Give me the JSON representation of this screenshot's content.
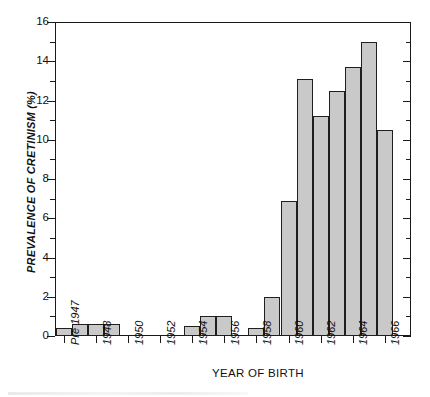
{
  "chart_data": {
    "type": "bar",
    "title": "",
    "xlabel": "YEAR OF BIRTH",
    "ylabel": "PREVALENCE OF CRETINISM (%)",
    "ylim": [
      0,
      16
    ],
    "y_major_ticks": [
      0,
      2,
      4,
      6,
      8,
      10,
      12,
      14,
      16
    ],
    "y_minor_ticks": [
      1,
      3,
      5,
      7,
      9,
      11,
      13,
      15
    ],
    "grid": false,
    "legend": null,
    "x_tick_labels": [
      "Pre 1947",
      "1948",
      "1950",
      "1952",
      "1954",
      "1956",
      "1958",
      "1960",
      "1962",
      "1964",
      "1966"
    ],
    "categories": [
      "Pre 1947",
      "1947",
      "1948",
      "1949",
      "1950",
      "1951",
      "1952",
      "1953",
      "1954",
      "1955",
      "1956",
      "1957",
      "1958",
      "1959",
      "1960",
      "1961",
      "1962",
      "1963",
      "1964",
      "1965",
      "1966"
    ],
    "values": [
      0.4,
      0.6,
      0.6,
      0.6,
      0,
      0,
      0,
      0,
      0.5,
      1.0,
      1.0,
      0,
      0.4,
      2.0,
      6.9,
      13.1,
      11.2,
      12.5,
      13.7,
      15.0,
      10.5
    ],
    "bar_fill_color": "#c9c9c9",
    "bar_edge_color": "#1f1f1f",
    "axis_color": "#1a1a1a"
  },
  "axis": {
    "y_labels": [
      "16",
      "14",
      "12",
      "10",
      "8",
      "6",
      "4",
      "2",
      "0"
    ],
    "x_labels": [
      "Pre 1947",
      "1948",
      "1950",
      "1952",
      "1954",
      "1956",
      "1958",
      "1960",
      "1962",
      "1964",
      "1966"
    ],
    "x_title": "YEAR OF BIRTH",
    "y_title": "PREVALENCE OF CRETINISM (%)"
  }
}
